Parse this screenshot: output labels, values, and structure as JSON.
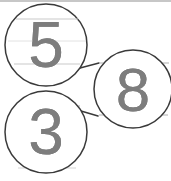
{
  "page": {
    "width": 171,
    "height": 181,
    "background_color": "#ffffff"
  },
  "colors": {
    "circle_stroke": "#3a3a3a",
    "connector_stroke": "#3a3a3a",
    "digit_color": "#7d7d7d",
    "rule_line_color": "#c9c9c9",
    "rule_line_faint_color": "#e2e2e2",
    "top_border_color": "#b4b4b4"
  },
  "nodes": [
    {
      "id": "node-5",
      "digit": "5",
      "cx": 46,
      "cy": 45,
      "r": 41,
      "font_size": 64
    },
    {
      "id": "node-3",
      "digit": "3",
      "cx": 46,
      "cy": 132,
      "r": 41,
      "font_size": 64
    },
    {
      "id": "node-8",
      "digit": "8",
      "cx": 133,
      "cy": 89,
      "r": 39,
      "font_size": 62
    }
  ],
  "connectors": [
    {
      "id": "connector-5-8",
      "from": "node-5",
      "to": "node-8",
      "x1": 80,
      "y1": 68,
      "x2": 99,
      "y2": 63
    },
    {
      "id": "connector-3-8",
      "from": "node-3",
      "to": "node-8",
      "x1": 81,
      "y1": 111,
      "x2": 98,
      "y2": 116
    }
  ],
  "rule_lines": [
    {
      "id": "rule-1",
      "y": 19,
      "x1": 16,
      "x2": 78,
      "weight": "solid"
    },
    {
      "id": "rule-2",
      "y": 41,
      "x1": 8,
      "x2": 86,
      "weight": "faint"
    },
    {
      "id": "rule-3",
      "y": 64,
      "x1": 14,
      "x2": 80,
      "weight": "solid"
    },
    {
      "id": "rule-4",
      "y": 63,
      "x1": 99,
      "x2": 169,
      "weight": "solid"
    },
    {
      "id": "rule-5",
      "y": 89,
      "x1": 95,
      "x2": 171,
      "weight": "faint"
    },
    {
      "id": "rule-6",
      "y": 115,
      "x1": 99,
      "x2": 168,
      "weight": "solid"
    },
    {
      "id": "rule-7",
      "y": 106,
      "x1": 15,
      "x2": 80,
      "weight": "solid"
    },
    {
      "id": "rule-8",
      "y": 129,
      "x1": 8,
      "x2": 86,
      "weight": "faint"
    },
    {
      "id": "rule-9",
      "y": 152,
      "x1": 13,
      "x2": 80,
      "weight": "solid"
    },
    {
      "id": "rule-10",
      "y": 168,
      "x1": 18,
      "x2": 76,
      "weight": "faint"
    }
  ],
  "top_border": {
    "y": 1,
    "x1": 0,
    "x2": 171
  }
}
